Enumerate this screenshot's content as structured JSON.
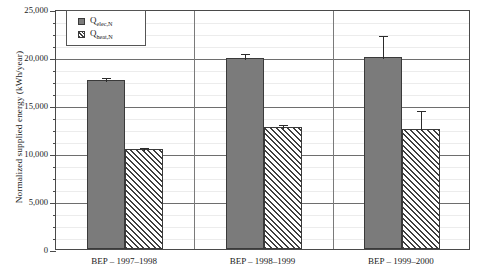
{
  "chart_data": {
    "type": "bar",
    "title": "",
    "xlabel": "",
    "ylabel": "Normalized supplied energy (kWh/year)",
    "ylim": [
      0,
      25000
    ],
    "ytick_labels": [
      "0",
      "5,000",
      "10,000",
      "15,000",
      "20,000",
      "25,000"
    ],
    "ytick_values": [
      0,
      5000,
      10000,
      15000,
      20000,
      25000
    ],
    "minor_tick_step": 1250,
    "grid": true,
    "legend_position": "top-left",
    "categories": [
      "BEP – 1997–1998",
      "BEP – 1998–1999",
      "BEP – 1999–2000"
    ],
    "series": [
      {
        "name": "Q_elec,N",
        "label_main": "Q",
        "label_sub": "elec,N",
        "fill": "solid",
        "color": "#7b7b7b",
        "values": [
          17600,
          19900,
          20000
        ],
        "errors": [
          400,
          600,
          2400
        ]
      },
      {
        "name": "Q_heat,N",
        "label_main": "Q",
        "label_sub": "heat,N",
        "fill": "diagonal-hatch",
        "color": "#f2f2f2",
        "values": [
          10400,
          12700,
          12500
        ],
        "errors": [
          300,
          400,
          2100
        ]
      }
    ]
  },
  "axis": {
    "y_title": "Normalized supplied energy (kWh/year)"
  }
}
